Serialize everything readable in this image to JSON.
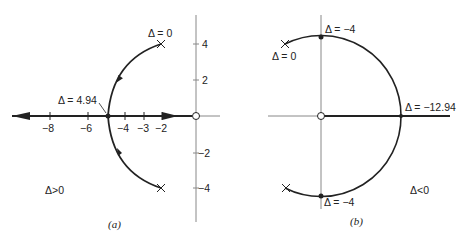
{
  "figure": {
    "panels": [
      {
        "id": "a",
        "caption": "(a)",
        "region_label": "Δ>0",
        "x_ticks": [
          {
            "value": -8,
            "label": "−8",
            "x": 50
          },
          {
            "value": -6,
            "label": "−6",
            "x": 88
          },
          {
            "value": -4,
            "label": "−4",
            "x": 125
          },
          {
            "value": -3,
            "label": "−3",
            "x": 144
          },
          {
            "value": -2,
            "label": "−2",
            "x": 162
          }
        ],
        "y_ticks": [
          {
            "value": 4,
            "label": "4",
            "y": 44
          },
          {
            "value": 2,
            "label": "2",
            "y": 80
          },
          {
            "value": -2,
            "label": "−2",
            "y": 153
          },
          {
            "value": -4,
            "label": "−4",
            "y": 188
          }
        ],
        "annotations": {
          "pole_top": "Δ = 0",
          "breakaway": "Δ = 4.94"
        }
      },
      {
        "id": "b",
        "caption": "(b)",
        "region_label": "Δ<0",
        "annotations": {
          "pole_top": "Δ = 0",
          "imag_cross_top": "Δ = −4",
          "imag_cross_bottom": "Δ = −4",
          "real_cross": "Δ = −12.94"
        }
      }
    ],
    "colors": {
      "ink": "#222222",
      "axis": "#777777",
      "background": "#ffffff"
    }
  }
}
